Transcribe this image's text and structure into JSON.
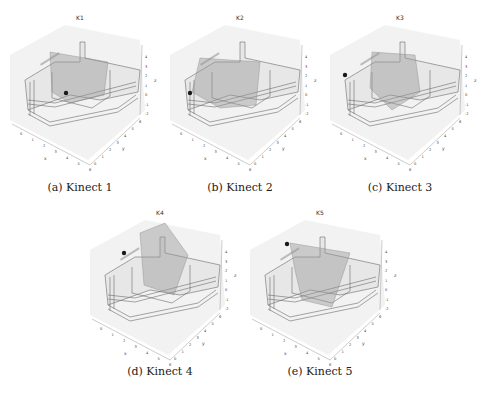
{
  "figure": {
    "panels": [
      {
        "id": "a",
        "plot_title": "K1",
        "caption": "(a) Kinect 1",
        "marker": {
          "x": 66,
          "y": 93
        },
        "frustum": "k1"
      },
      {
        "id": "b",
        "plot_title": "K2",
        "caption": "(b) Kinect 2",
        "marker": {
          "x": 30,
          "y": 93
        },
        "frustum": "k2"
      },
      {
        "id": "c",
        "plot_title": "K3",
        "caption": "(c) Kinect 3",
        "marker": {
          "x": 25,
          "y": 75
        },
        "frustum": "k3"
      },
      {
        "id": "d",
        "plot_title": "K4",
        "caption": "(d) Kinect 4",
        "marker": {
          "x": 44,
          "y": 58
        },
        "frustum": "k4"
      },
      {
        "id": "e",
        "plot_title": "K5",
        "caption": "(e) Kinect 5",
        "marker": {
          "x": 47,
          "y": 49
        },
        "frustum": "k5"
      }
    ],
    "axes": {
      "x_ticks": [
        "0",
        "1",
        "2",
        "3",
        "4",
        "5",
        "6"
      ],
      "y_ticks": [
        "0",
        "1",
        "2",
        "3",
        "4",
        "5",
        "6"
      ],
      "z_ticks": [
        "4",
        "3",
        "2",
        "1",
        "0",
        "-1",
        "-2"
      ],
      "x_label": "x",
      "y_label": "y",
      "z_label": "z"
    },
    "colors": {
      "room_edges": "#6b6b6b",
      "frustum_fill": "#9a9a9a",
      "marker": "#1a1a1a",
      "pane_bg": "#f2f2f2"
    }
  }
}
